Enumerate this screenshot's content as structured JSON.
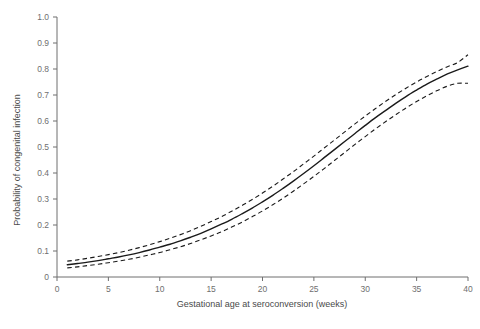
{
  "chart_data": {
    "type": "line",
    "title": "",
    "xlabel": "Gestational age at seroconversion (weeks)",
    "ylabel": "Probability of congenital infection",
    "xlim": [
      0,
      40
    ],
    "ylim": [
      0,
      1.0
    ],
    "grid": false,
    "legend": null,
    "xticks": [
      0,
      5,
      10,
      15,
      20,
      25,
      30,
      35,
      40
    ],
    "xtick_labels": [
      "0",
      "5",
      "10",
      "15",
      "20",
      "25",
      "30",
      "35",
      "40"
    ],
    "yticks": [
      0,
      0.1,
      0.2,
      0.3,
      0.4,
      0.5,
      0.6,
      0.7,
      0.8,
      0.9,
      1.0
    ],
    "ytick_labels": [
      "0",
      "0.1",
      "0.2",
      "0.3",
      "0.4",
      "0.5",
      "0.6",
      "0.7",
      "0.8",
      "0.9",
      "1.0"
    ],
    "x": [
      1,
      2,
      3,
      4,
      5,
      6,
      7,
      8,
      9,
      10,
      11,
      12,
      13,
      14,
      15,
      16,
      17,
      18,
      19,
      20,
      21,
      22,
      23,
      24,
      25,
      26,
      27,
      28,
      29,
      30,
      31,
      32,
      33,
      34,
      35,
      36,
      37,
      38,
      39,
      40
    ],
    "series": [
      {
        "name": "Estimated probability of congenital infection",
        "style": "solid",
        "color": "#1a1a1a",
        "values": [
          0.047,
          0.052,
          0.057,
          0.063,
          0.07,
          0.077,
          0.085,
          0.094,
          0.104,
          0.115,
          0.126,
          0.139,
          0.153,
          0.168,
          0.185,
          0.203,
          0.222,
          0.243,
          0.265,
          0.289,
          0.314,
          0.341,
          0.369,
          0.398,
          0.428,
          0.459,
          0.49,
          0.521,
          0.552,
          0.583,
          0.613,
          0.641,
          0.669,
          0.695,
          0.719,
          0.742,
          0.762,
          0.781,
          0.797,
          0.811
        ]
      },
      {
        "name": "Upper 95% confidence limit",
        "style": "dashed",
        "color": "#1a1a1a",
        "values": [
          0.061,
          0.066,
          0.072,
          0.079,
          0.086,
          0.094,
          0.103,
          0.113,
          0.124,
          0.136,
          0.149,
          0.163,
          0.178,
          0.195,
          0.213,
          0.232,
          0.253,
          0.275,
          0.298,
          0.323,
          0.349,
          0.377,
          0.405,
          0.435,
          0.465,
          0.496,
          0.527,
          0.558,
          0.589,
          0.619,
          0.648,
          0.676,
          0.702,
          0.727,
          0.75,
          0.771,
          0.791,
          0.809,
          0.825,
          0.855
        ]
      },
      {
        "name": "Lower 95% confidence limit",
        "style": "dashed",
        "color": "#1a1a1a",
        "values": [
          0.035,
          0.039,
          0.044,
          0.049,
          0.055,
          0.061,
          0.068,
          0.076,
          0.085,
          0.094,
          0.105,
          0.116,
          0.129,
          0.143,
          0.158,
          0.174,
          0.192,
          0.211,
          0.232,
          0.254,
          0.278,
          0.303,
          0.33,
          0.358,
          0.387,
          0.417,
          0.448,
          0.479,
          0.51,
          0.54,
          0.57,
          0.598,
          0.625,
          0.651,
          0.675,
          0.697,
          0.717,
          0.734,
          0.745,
          0.745
        ]
      }
    ]
  },
  "plot_geometry": {
    "left": 57,
    "right": 468,
    "top": 17,
    "bottom": 277
  }
}
